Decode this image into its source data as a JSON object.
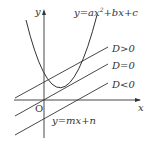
{
  "diagram": {
    "axes": {
      "x_label": "x",
      "y_label": "y",
      "origin_label": "O"
    },
    "curve": {
      "label": "y=ax²+bx+c",
      "label_parts": {
        "pre": "y=ax",
        "sup": "2",
        "post": "+bx+c"
      }
    },
    "lines": [
      {
        "label": "D>0"
      },
      {
        "label": "D=0"
      },
      {
        "label": "D<0"
      }
    ],
    "line_family_label": "y=mx+n",
    "colors": {
      "stroke": "#333333",
      "background": "#ffffff"
    }
  }
}
